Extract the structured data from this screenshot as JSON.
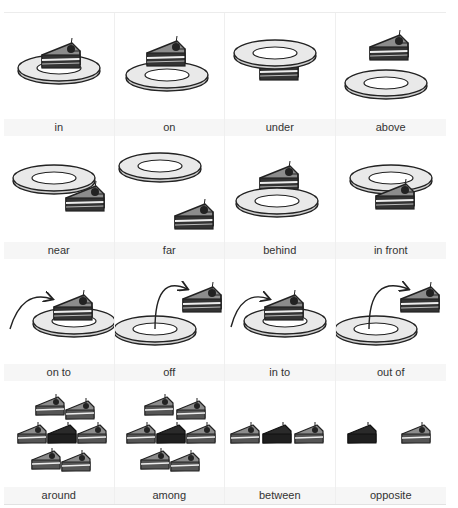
{
  "cards": [
    {
      "label": "in",
      "scene": "cake-in-plate"
    },
    {
      "label": "on",
      "scene": "cake-on-plate"
    },
    {
      "label": "under",
      "scene": "cake-under-plate"
    },
    {
      "label": "above",
      "scene": "cake-above-plate"
    },
    {
      "label": "near",
      "scene": "cake-near-plate"
    },
    {
      "label": "far",
      "scene": "cake-far-from-plate"
    },
    {
      "label": "behind",
      "scene": "cake-behind-plate"
    },
    {
      "label": "in front",
      "scene": "cake-in-front-of-plate"
    },
    {
      "label": "on to",
      "scene": "cake-moving-onto-plate"
    },
    {
      "label": "off",
      "scene": "cake-moving-off-plate"
    },
    {
      "label": "in to",
      "scene": "cake-moving-into-plate"
    },
    {
      "label": "out of",
      "scene": "cake-moving-out-of-plate"
    },
    {
      "label": "around",
      "scene": "dark-cake-surrounded"
    },
    {
      "label": "among",
      "scene": "dark-cake-among-others"
    },
    {
      "label": "between",
      "scene": "dark-cake-between-two"
    },
    {
      "label": "opposite",
      "scene": "dark-cake-opposite-light-cake"
    }
  ],
  "colors": {
    "cake_top": "#8c8c8c",
    "cake_dark": "#2a2a2a",
    "plate": "#e9e9e9",
    "outline": "#222222",
    "label_band": "#f6f6f6"
  }
}
